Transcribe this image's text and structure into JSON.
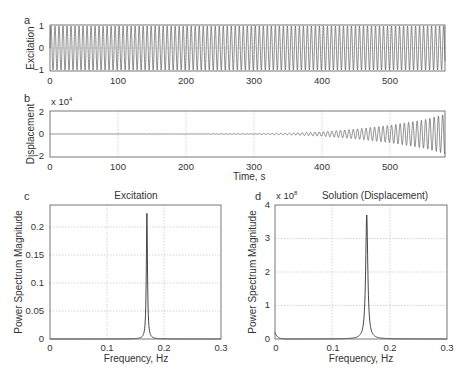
{
  "chart_data": [
    {
      "panel": "a",
      "type": "line",
      "title": "",
      "xlabel": "",
      "ylabel": "Excitation",
      "xlim": [
        0,
        580
      ],
      "ylim": [
        -1,
        1
      ],
      "xticks": [
        "0",
        "100",
        "200",
        "300",
        "400",
        "500"
      ],
      "yticks": [
        "-1",
        "0",
        "1"
      ],
      "grid": true,
      "description": "Constant-amplitude sinusoid, amplitude 1, frequency ~0.17 Hz over 0-580 s",
      "series": [
        {
          "name": "excitation",
          "amplitude": 1,
          "frequency_hz": 0.17
        }
      ]
    },
    {
      "panel": "b",
      "type": "line",
      "title": "",
      "xlabel": "Time, s",
      "ylabel": "Displacement",
      "multiplier": "x 10^4",
      "xlim": [
        0,
        580
      ],
      "ylim": [
        -2,
        2
      ],
      "xticks": [
        "0",
        "100",
        "200",
        "300",
        "400",
        "500"
      ],
      "yticks": [
        "-2",
        "0",
        "2"
      ],
      "grid": true,
      "description": "Oscillation near zero until ~300 s then growing amplitude reaching ~1.8e4 at 580 s",
      "series": [
        {
          "name": "displacement",
          "x": [
            0,
            300,
            350,
            400,
            450,
            500,
            550,
            580
          ],
          "envelope": [
            0,
            0.02,
            0.08,
            0.2,
            0.45,
            0.8,
            1.3,
            1.8
          ]
        }
      ]
    },
    {
      "panel": "c",
      "type": "line",
      "title": "Excitation",
      "xlabel": "Frequency,  Hz",
      "ylabel": "Power Spectrum Magnitude",
      "xlim": [
        0,
        0.3
      ],
      "ylim": [
        0,
        0.24
      ],
      "xticks": [
        "0",
        "0.1",
        "0.2",
        "0.3"
      ],
      "yticks": [
        "0",
        "0.05",
        "0.1",
        "0.15",
        "0.2"
      ],
      "grid": true,
      "series": [
        {
          "name": "excitation spectrum",
          "peak_frequency": 0.17,
          "peak_value": 0.225
        }
      ]
    },
    {
      "panel": "d",
      "type": "line",
      "title": "Solution (Displacement)",
      "xlabel": "Frequency,  Hz",
      "ylabel": "Power Spectrum Magnitude",
      "multiplier": "x 10^8",
      "xlim": [
        0,
        0.3
      ],
      "ylim": [
        0,
        4
      ],
      "xticks": [
        "0",
        "0.1",
        "0.2",
        "0.3"
      ],
      "yticks": [
        "0",
        "1",
        "2",
        "3",
        "4"
      ],
      "grid": true,
      "series": [
        {
          "name": "displacement spectrum",
          "peak_frequency": 0.16,
          "peak_value": 3.7
        }
      ]
    }
  ],
  "panels": {
    "a": {
      "letter": "a",
      "ylabel": "Excitation",
      "yticks": [
        "1",
        "0",
        "−1"
      ],
      "xticks": [
        "0",
        "100",
        "200",
        "300",
        "400",
        "500"
      ]
    },
    "b": {
      "letter": "b",
      "ylabel": "Displacement",
      "multiplier_base": "x 10",
      "multiplier_exp": "4",
      "yticks": [
        "2",
        "0",
        "−2"
      ],
      "xticks": [
        "0",
        "100",
        "200",
        "300",
        "400",
        "500"
      ],
      "xlabel": "Time, s"
    },
    "c": {
      "letter": "c",
      "title": "Excitation",
      "ylabel": "Power Spectrum Magnitude",
      "yticks": [
        "0.2",
        "0.15",
        "0.1",
        "0.05",
        "0"
      ],
      "xticks": [
        "0",
        "0.1",
        "0.2",
        "0.3"
      ],
      "xlabel": "Frequency,  Hz"
    },
    "d": {
      "letter": "d",
      "title": "Solution (Displacement)",
      "multiplier_base": "x 10",
      "multiplier_exp": "8",
      "ylabel": "Power Spectrum Magnitude",
      "yticks": [
        "4",
        "3",
        "2",
        "1",
        "0"
      ],
      "xticks": [
        "0",
        "0.1",
        "0.2",
        "0.3"
      ],
      "xlabel": "Frequency,  Hz"
    }
  }
}
